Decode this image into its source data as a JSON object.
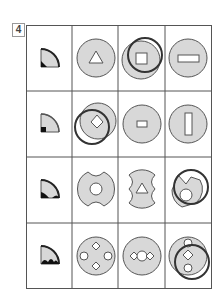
{
  "question": {
    "number": "4"
  },
  "grid": {
    "rows": 4,
    "columns": 4,
    "cells": [
      [
        "quarter-circle key (black corner)",
        "grey circle with white triangle",
        "grey circle with white square, overlaid dark ring offset up-right",
        "grey circle with white horizontal rectangle"
      ],
      [
        "quarter-circle key (black square corner)",
        "grey circle with white diamond, overlaid dark ring offset down-left",
        "grey circle with small white rectangle",
        "grey circle with white vertical rectangle"
      ],
      [
        "quarter-circle key (black corner, dark arc)",
        "grey notched disc with white center circle",
        "grey notched disc with white triangle",
        "notched disc with white circle, overlaid dark ring offset up-right"
      ],
      [
        "quarter-circle key (black bumps)",
        "grey circle with diamonds and circles in cross",
        "grey circle with diamond-circle-diamond row",
        "grey circle with circle-diamond-circle column, overlaid dark ring offset down-right"
      ]
    ]
  },
  "colors": {
    "fill": "#d8d8d8",
    "stroke": "#555555",
    "ring": "#333333",
    "black": "#111111"
  }
}
